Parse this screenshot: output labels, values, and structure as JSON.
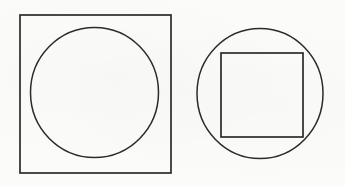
{
  "document": {
    "title": "Geometric Figures",
    "kind": "line-drawing",
    "background_color": "#fbfbfa",
    "stroke_color": "#2b2b2b",
    "canvas": {
      "width": 345,
      "height": 187
    }
  },
  "figures": [
    {
      "id": "figure-left",
      "name": "circle-inscribed-in-square",
      "description": "Square with an inscribed circle",
      "outer": {
        "shape": "square",
        "x": 20,
        "y": 15,
        "width": 151,
        "height": 158
      },
      "inner": {
        "shape": "circle",
        "cx": 94.5,
        "cy": 92.5,
        "rx": 64,
        "ry": 65
      }
    },
    {
      "id": "figure-right",
      "name": "square-inscribed-in-circle",
      "description": "Circle with an inscribed square",
      "outer": {
        "shape": "circle",
        "cx": 260,
        "cy": 93.5,
        "rx": 63,
        "ry": 65
      },
      "inner": {
        "shape": "square",
        "x": 221,
        "y": 53,
        "width": 82,
        "height": 84
      }
    }
  ]
}
